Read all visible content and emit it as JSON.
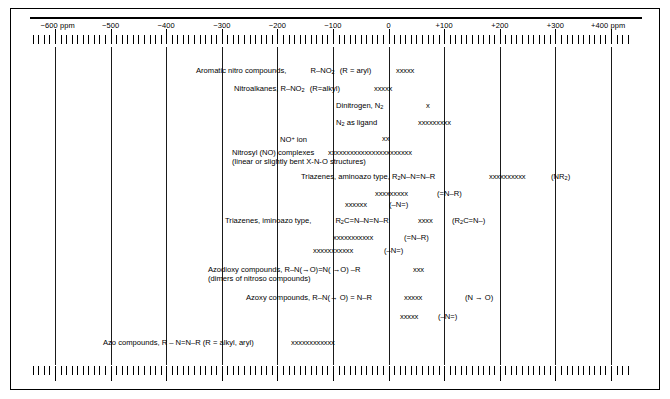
{
  "figure": {
    "kind": "nmr-chemical-shift-correlation-chart",
    "unit": "ppm"
  },
  "chart_data": {
    "type": "table",
    "title": "",
    "xlabel": "ppm",
    "ylabel": "",
    "xlim": [
      -600,
      400
    ],
    "grid": true,
    "legend": "none",
    "axis": {
      "unit_prefix": "ppm",
      "unit_suffix": "ppm",
      "major_step": 100,
      "minor_step": 10,
      "tick_labels": [
        "−600 ppm",
        "−500",
        "−400",
        "−300",
        "−200",
        "−100",
        "0",
        "+100",
        "+200",
        "+300",
        "+400 ppm"
      ],
      "tick_values": [
        -600,
        -500,
        -400,
        -300,
        -200,
        -100,
        0,
        100,
        200,
        300,
        400
      ]
    },
    "categories": [
      "Aromatic nitro compounds, R–NO2 (R = aryl)",
      "Nitroalkanes, R–NO2 (R=alkyl)",
      "Dinitrogen, N2",
      "N2 as ligand",
      "NO+ ion",
      "Nitrosyl (NO) complexes (linear or slightly bent X-N-O structures)",
      "Triazenes, aminoazo type, R2N–N=N–R (NR2)",
      "Triazenes, aminoazo type (=N–R)",
      "Triazenes, aminoazo type (–N=)",
      "Triazenes, iminoazo type, R2C=N–N=N–R (R2C=N–)",
      "Triazenes, iminoazo type (=N–R)",
      "Triazenes, iminoazo type (–N=)",
      "Azodioxy compounds, R–N(→O)=N(→O)–R (dimers of nitroso compounds)",
      "Azoxy compounds, R–N(→O) = N–R (N→O)",
      "Azoxy compounds (–N=)",
      "Azo compounds, R – N=N–R (R = alkyl, aryl)"
    ],
    "ranges": [
      {
        "label": "Aromatic nitro compounds",
        "start": 15,
        "end": 50,
        "marks": 5
      },
      {
        "label": "Nitroalkanes",
        "start": -5,
        "end": 30,
        "marks": 5
      },
      {
        "label": "Dinitrogen N2",
        "start": 60,
        "end": 68,
        "marks": 1
      },
      {
        "label": "N2 as ligand",
        "start": 55,
        "end": 120,
        "marks": 9
      },
      {
        "label": "NO+ ion",
        "start": -5,
        "end": 10,
        "marks": 2
      },
      {
        "label": "Nitrosyl complexes",
        "start": -105,
        "end": 60,
        "marks": 23
      },
      {
        "label": "Triazenes aminoazo NR2",
        "start": 165,
        "end": 235,
        "marks": 10
      },
      {
        "label": "Triazenes aminoazo =N-R",
        "start": -25,
        "end": 45,
        "marks": 10
      },
      {
        "label": "Triazenes aminoazo -N=",
        "start": -70,
        "end": -25,
        "marks": 6
      },
      {
        "label": "Triazenes iminoazo R2C=N-",
        "start": 75,
        "end": 105,
        "marks": 4
      },
      {
        "label": "Triazenes iminoazo =N-R",
        "start": -95,
        "end": -20,
        "marks": 11
      },
      {
        "label": "Triazenes iminoazo -N=",
        "start": -125,
        "end": -50,
        "marks": 11
      },
      {
        "label": "Azodioxy compounds",
        "start": 60,
        "end": 85,
        "marks": 3
      },
      {
        "label": "Azoxy compounds N->O",
        "start": 55,
        "end": 90,
        "marks": 5
      },
      {
        "label": "Azoxy compounds -N=",
        "start": 50,
        "end": 85,
        "marks": 5
      },
      {
        "label": "Azo compounds",
        "start": -220,
        "end": -140,
        "marks": 12
      }
    ]
  },
  "axis": {
    "labels": [
      {
        "text": "−600 ppm",
        "value": -600
      },
      {
        "text": "−500",
        "value": -500
      },
      {
        "text": "−400",
        "value": -400
      },
      {
        "text": "−300",
        "value": -300
      },
      {
        "text": "−200",
        "value": -200
      },
      {
        "text": "−100",
        "value": -100
      },
      {
        "text": "0",
        "value": 0
      },
      {
        "text": "+100",
        "value": 100
      },
      {
        "text": "+200",
        "value": 200
      },
      {
        "text": "+300",
        "value": 300
      },
      {
        "text": "+400 ppm",
        "value": 400
      }
    ]
  },
  "rows": {
    "r1": {
      "label_a": "Aromatic nitro compounds,",
      "label_b": "R–NO",
      "label_b_sub": "2",
      "label_c": "(R = aryl)",
      "marks": "xxxxx"
    },
    "r2": {
      "label_a": "Nitroalkanes, R–NO",
      "label_a_sub": "2",
      "label_b": "(R=alkyl)",
      "marks": "xxxxx"
    },
    "r3": {
      "label_a": "Dinitrogen,  N",
      "label_a_sub": "2",
      "marks": "x"
    },
    "r4": {
      "label_a": "N",
      "label_a_sub": "2",
      "label_b": " as ligand",
      "marks": "xxxxxxxxx"
    },
    "r5": {
      "label_a": "NO",
      "label_a_sup": "+",
      "label_b": " ion",
      "marks": "xx"
    },
    "r6": {
      "label_a": "Nitrosyl (NO) complexes",
      "label_b": "(linear or slightly bent  X-N-O  structures)",
      "marks": "xxxxxxxxxxxxxxxxxxxxxxx"
    },
    "r7": {
      "label_a": "Triazenes, aminoazo type,  R",
      "label_a_sub": "2",
      "label_b": "N–N=N–R",
      "marks": "xxxxxxxxxx",
      "note": "(NR",
      "note_sub": "2",
      "note_end": ")"
    },
    "r8": {
      "marks": "xxxxxxxxx",
      "note": "(=N–R)"
    },
    "r9": {
      "marks": "xxxxxx",
      "note": "(–N=)"
    },
    "r10": {
      "label_a": "Triazenes, iminoazo type,",
      "label_b": "R",
      "label_b_sub": "2",
      "label_c": "C=N–N=N–R",
      "marks": "xxxx",
      "note": "(R",
      "note_sub": "2",
      "note_end": "C=N–)"
    },
    "r11": {
      "marks": "xxxxxxxxxxx",
      "note": "(=N–R)"
    },
    "r12": {
      "marks": "xxxxxxxxxxx",
      "note": "(–N=)"
    },
    "r13": {
      "label_a": "Azodioxy compounds,   R–N(→O)=N( →O) –R",
      "label_b": "(dimers of nitroso compounds)",
      "marks": "xxx"
    },
    "r14": {
      "label_a": "Azoxy compounds, R–N(→ O) = N–R",
      "marks": "xxxxx",
      "note": "(N → O)"
    },
    "r15": {
      "marks": "xxxxx",
      "note": "(–N=)"
    },
    "r16": {
      "label_a": "Azo compounds,  R – N=N–R  (R = alkyl, aryl)",
      "marks": "xxxxxxxxxxxx"
    }
  }
}
